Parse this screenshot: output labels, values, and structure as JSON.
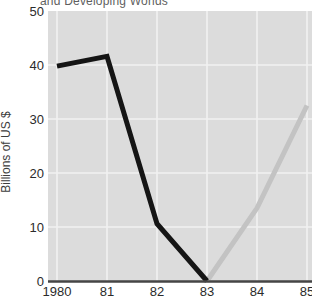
{
  "title_fragment": "and Developing Worlds",
  "chart_data": {
    "type": "line",
    "title": "and Developing Worlds",
    "xlabel": "",
    "ylabel": "Billions of US $",
    "x_tick_labels": [
      "1980",
      "81",
      "82",
      "83",
      "84",
      "85"
    ],
    "x_values": [
      1980,
      1981,
      1982,
      1983,
      1984,
      1985
    ],
    "y_ticks": [
      0,
      10,
      20,
      30,
      40,
      50
    ],
    "ylim": [
      0,
      50
    ],
    "grid": true,
    "legend": "none",
    "series": [
      {
        "name": "black-line",
        "color": "#151515",
        "points": [
          [
            1980,
            39.8
          ],
          [
            1981,
            41.6
          ],
          [
            1982,
            10.6
          ],
          [
            1983,
            0
          ]
        ]
      },
      {
        "name": "gray-line",
        "color": "#c3c3c3",
        "points": [
          [
            1983,
            0
          ],
          [
            1984,
            13.5
          ],
          [
            1985,
            32.5
          ]
        ]
      }
    ],
    "colors": {
      "plot_bg": "#dcdcdc",
      "gridline": "#f2f2f2",
      "axis_line": "#454545",
      "tick_text": "#2b2b2b",
      "title_text": "#5f5f5f",
      "ylabel_text": "#3d3d3d"
    }
  }
}
